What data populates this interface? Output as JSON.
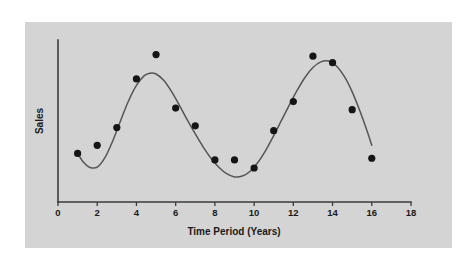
{
  "figure": {
    "panel_background": "#d4d4d4",
    "page_background": "#ffffff",
    "curve_color": "#555555",
    "point_color": "#151515",
    "axis_color": "#3b3b3b"
  },
  "chart_data": {
    "type": "scatter",
    "title": "",
    "subtitle": "",
    "xlabel": "Time Period (Years)",
    "ylabel": "Sales",
    "xlim": [
      0,
      18
    ],
    "ylim": [
      0,
      100
    ],
    "xticks": [
      0,
      2,
      4,
      6,
      8,
      10,
      12,
      14,
      16,
      18
    ],
    "xtick_labels": [
      "0",
      "2",
      "4",
      "6",
      "8",
      "10",
      "12",
      "14",
      "16",
      "18"
    ],
    "yticks": [],
    "ytick_labels": [],
    "grid": false,
    "legend": null,
    "legend_position": "none",
    "annotations": [],
    "series": [
      {
        "name": "Sales observations",
        "type": "scatter",
        "marker": "filled-circle",
        "marker_size_px": 3.6,
        "color": "#151515",
        "x": [
          1,
          2,
          3,
          4,
          5,
          6,
          7,
          8,
          9,
          10,
          11,
          12,
          13,
          14,
          15,
          16
        ],
        "y": [
          30,
          35,
          46,
          76,
          91,
          58,
          47,
          26,
          26,
          21,
          44,
          62,
          90,
          86,
          57,
          27
        ]
      },
      {
        "name": "Fitted cyclical trend curve",
        "type": "line",
        "color": "#555555",
        "x": [
          1.0,
          1.3,
          1.6,
          2.0,
          2.4,
          2.8,
          3.2,
          3.6,
          4.0,
          4.4,
          4.7,
          5.0,
          5.4,
          5.8,
          6.2,
          6.6,
          7.0,
          7.4,
          7.8,
          8.2,
          8.6,
          9.0,
          9.4,
          9.8,
          10.2,
          10.6,
          11.0,
          11.4,
          11.8,
          12.2,
          12.6,
          13.0,
          13.4,
          13.8,
          14.2,
          14.6,
          15.0,
          15.4,
          15.8,
          16.0
        ],
        "y": [
          30.0,
          24.5,
          21.5,
          21.5,
          27.5,
          38.0,
          50.5,
          62.5,
          72.0,
          78.0,
          79.5,
          79.0,
          75.0,
          68.0,
          59.5,
          50.5,
          42.0,
          34.0,
          27.0,
          21.5,
          17.5,
          15.5,
          16.0,
          19.0,
          24.5,
          32.0,
          41.0,
          50.5,
          60.0,
          69.0,
          77.0,
          83.0,
          86.5,
          87.0,
          84.0,
          77.5,
          68.0,
          56.0,
          42.5,
          35.0
        ]
      }
    ]
  }
}
